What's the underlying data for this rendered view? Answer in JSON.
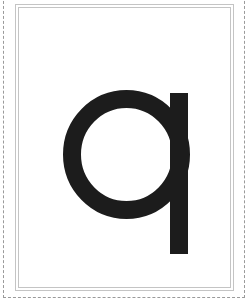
{
  "card": {
    "letter": "q",
    "letter_color": "#1c1c1c",
    "frame_color": "#c4c4c4",
    "cut_line_color": "#9a9a9a",
    "background": "#ffffff"
  }
}
